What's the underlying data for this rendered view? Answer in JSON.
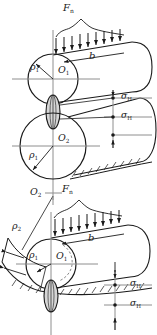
{
  "figure": {
    "type": "engineering-diagram",
    "panels": [
      {
        "id": "upper",
        "description": "Two convex cylinders in external contact under normal load",
        "labels": [
          "F_n",
          "b",
          "rho_1",
          "O_1",
          "rho_1",
          "O_2",
          "sigma_H",
          "sigma_H"
        ]
      },
      {
        "id": "lower",
        "description": "Convex cylinder in contact with a concave cylindrical surface under normal load",
        "labels": [
          "O_2",
          "rho_2",
          "F_n",
          "b",
          "rho_1",
          "O_1",
          "sigma_H",
          "sigma_H"
        ]
      }
    ]
  },
  "labels": {
    "force_upper": "F",
    "force_upper_sub": "n",
    "force_lower": "F",
    "force_lower_sub": "n",
    "width_upper": "b",
    "width_lower": "b",
    "rho1_upper": "ρ",
    "rho1_upper_sub": "1",
    "O1_upper": "O",
    "O1_upper_sub": "1",
    "rho1_mid": "ρ",
    "rho1_mid_sub": "1",
    "O2_upper": "O",
    "O2_upper_sub": "2",
    "sigmaH_u1": "σ",
    "sigmaH_u1_sub": "H",
    "sigmaH_u2": "σ",
    "sigmaH_u2_sub": "H",
    "O2_lower": "O",
    "O2_lower_sub": "2",
    "rho2_lower": "ρ",
    "rho2_lower_sub": "2",
    "rho1_lower": "ρ",
    "rho1_lower_sub": "1",
    "O1_lower": "O",
    "O1_lower_sub": "1",
    "sigmaH_l1": "σ",
    "sigmaH_l1_sub": "H",
    "sigmaH_l2": "σ",
    "sigmaH_l2_sub": "H"
  },
  "colors": {
    "stroke": "#1a1a1a",
    "axis": "#8e8e8e",
    "contact_fill": "#d8d8d8",
    "background": "#ffffff"
  }
}
